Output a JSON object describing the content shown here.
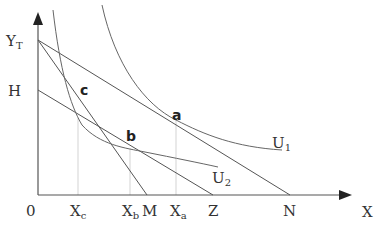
{
  "diagram": {
    "type": "indifference-curve budget-line diagram",
    "axes": {
      "x_label": "X",
      "y_label": ""
    },
    "y_axis_labels": [
      {
        "id": "yt",
        "main": "Y",
        "sub": "T"
      },
      {
        "id": "h",
        "main": "H",
        "sub": ""
      }
    ],
    "x_axis_labels": [
      {
        "id": "origin",
        "main": "0",
        "sub": ""
      },
      {
        "id": "xc",
        "main": "X",
        "sub": "c"
      },
      {
        "id": "xb",
        "main": "X",
        "sub": "b"
      },
      {
        "id": "m",
        "main": "M",
        "sub": ""
      },
      {
        "id": "xa",
        "main": "X",
        "sub": "a"
      },
      {
        "id": "z",
        "main": "Z",
        "sub": ""
      },
      {
        "id": "n",
        "main": "N",
        "sub": ""
      }
    ],
    "points": [
      {
        "id": "a",
        "label": "a"
      },
      {
        "id": "b",
        "label": "b"
      },
      {
        "id": "c",
        "label": "c"
      }
    ],
    "curves": [
      {
        "id": "u1",
        "main": "U",
        "sub": "1"
      },
      {
        "id": "u2",
        "main": "U",
        "sub": "2"
      }
    ],
    "lines": [
      {
        "id": "yt-n",
        "from": "Y_T",
        "to": "N"
      },
      {
        "id": "yt-m",
        "from": "Y_T",
        "to": "M"
      },
      {
        "id": "h-z",
        "from": "H",
        "to": "Z"
      }
    ]
  }
}
